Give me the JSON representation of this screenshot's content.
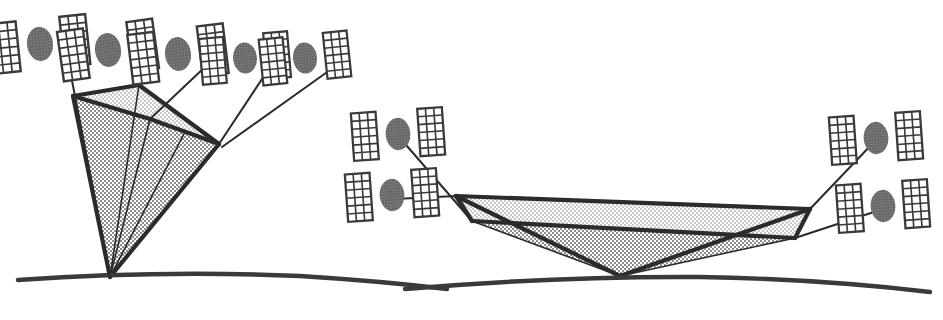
{
  "figure": {
    "background_color": "#ffffff",
    "width": 943,
    "height": 320,
    "panels": [
      {
        "id": "left-panel",
        "name": "high-elevation-coverage-cone",
        "description": "Narrow steep coverage cone from a ground point toward a dense arc of satellites"
      },
      {
        "id": "right-panel",
        "name": "low-elevation-coverage-cone",
        "description": "Wide shallow coverage cone from a ground point toward two flanking satellite pairs"
      }
    ]
  },
  "style": {
    "stroke_color": "#2b2b2b",
    "ground_color": "#3a3a3a",
    "cone_dark_fill": "#a8a8a8",
    "cone_light_fill": "#d8d8d8",
    "satellite_body_color": "#6e6e6e",
    "satellite_panel_fill": "#ffffff",
    "satellite_panel_stroke": "#3a3a3a",
    "link_line_color": "#2b2b2b"
  },
  "geometry": {
    "ground_left": {
      "label": "earth-surface-arc-left",
      "path": "M 18 280 Q 160 270 300 276 Q 380 281 447 289"
    },
    "ground_right": {
      "label": "earth-surface-arc-right",
      "path": "M 405 289 Q 560 276 700 277 Q 820 279 930 292"
    },
    "cone_left": {
      "label": "coverage-cone-left",
      "apex": [
        110,
        277
      ],
      "rim_left": [
        73,
        96
      ],
      "rim_top": [
        139,
        85
      ],
      "rim_right": [
        219,
        144
      ],
      "rim_mid_front": [
        150,
        119
      ],
      "dark_fill_path": "M 110 277 L 73 96 L 150 119 L 219 144 Z",
      "light_fill_path": "M 73 96 L 139 85 L 219 144 L 150 119 Z",
      "edges": [
        "M 110 277 L 73 96",
        "M 110 277 L 219 144",
        "M 73 96 L 139 85",
        "M 139 85 L 219 144",
        "M 73 96 L 150 119",
        "M 150 119 L 219 144"
      ],
      "interior_rays": [
        "M 110 277 L 139 85",
        "M 110 277 L 150 119",
        "M 110 277 L 185 132"
      ]
    },
    "cone_right": {
      "label": "coverage-cone-right",
      "apex": [
        620,
        276
      ],
      "rim_left_far": [
        456,
        196
      ],
      "rim_left_near": [
        472,
        221
      ],
      "rim_right_far": [
        810,
        209
      ],
      "rim_right_near": [
        795,
        238
      ],
      "dark_fill_path": "M 620 276 L 472 221 L 795 238 Z",
      "light_fill_path": "M 456 196 L 810 209 L 795 238 L 472 221 Z",
      "edges": [
        "M 620 276 L 456 196",
        "M 620 276 L 810 209",
        "M 456 196 L 810 209",
        "M 472 221 L 795 238",
        "M 456 196 L 472 221",
        "M 810 209 L 795 238"
      ],
      "interior_rays": [
        "M 620 276 L 472 221",
        "M 620 276 L 795 238"
      ]
    }
  },
  "satellites": [
    {
      "name": "satellite-l1",
      "x": 40,
      "y": 44,
      "rot": -6,
      "scale": 1.0,
      "panels": "both",
      "left_panel": false
    },
    {
      "name": "satellite-l2",
      "x": 108,
      "y": 50,
      "rot": -8,
      "scale": 1.0,
      "panels": "both",
      "left_panel": true
    },
    {
      "name": "satellite-l3",
      "x": 178,
      "y": 54,
      "rot": -7,
      "scale": 1.0,
      "panels": "both",
      "left_panel": true
    },
    {
      "name": "satellite-l4",
      "x": 245,
      "y": 58,
      "rot": -5,
      "scale": 0.92,
      "panels": "both",
      "left_panel": true
    },
    {
      "name": "satellite-l5",
      "x": 305,
      "y": 58,
      "rot": -6,
      "scale": 0.92,
      "panels": "both",
      "left_panel": true
    },
    {
      "name": "satellite-r1",
      "x": 398,
      "y": 134,
      "rot": -4,
      "scale": 0.95,
      "panels": "both",
      "left_panel": true
    },
    {
      "name": "satellite-r2",
      "x": 392,
      "y": 195,
      "rot": -4,
      "scale": 0.95,
      "panels": "both",
      "left_panel": true
    },
    {
      "name": "satellite-r3",
      "x": 876,
      "y": 138,
      "rot": -4,
      "scale": 0.95,
      "panels": "both",
      "left_panel": true
    },
    {
      "name": "satellite-r4",
      "x": 883,
      "y": 206,
      "rot": -4,
      "scale": 0.95,
      "panels": "both",
      "left_panel": true
    }
  ],
  "link_lines": [
    {
      "name": "link-l1-to-rim-left",
      "path": "M 68 60 L 110 277"
    },
    {
      "name": "link-l2-to-rim-top",
      "path": "M 136 62 L 139 85"
    },
    {
      "name": "link-l3-to-rim-mid",
      "path": "M 206 66 L 150 119"
    },
    {
      "name": "link-l4-to-rim-right",
      "path": "M 268 70 L 219 144"
    },
    {
      "name": "link-l5-to-rim-right",
      "path": "M 330 70 L 222 147"
    },
    {
      "name": "link-r1-to-cone",
      "path": "M 400 138 L 472 221"
    },
    {
      "name": "link-r2-to-cone",
      "path": "M 394 199 L 456 196"
    },
    {
      "name": "link-r3-to-cone",
      "path": "M 874 142 L 810 209"
    },
    {
      "name": "link-r4-to-cone",
      "path": "M 880 210 L 795 238"
    }
  ],
  "satellite_panel_spec": {
    "cols": 3,
    "rows": 6,
    "panel_width": 26,
    "panel_height": 50,
    "gap": 22,
    "body_rx": 13,
    "body_ry": 17
  }
}
